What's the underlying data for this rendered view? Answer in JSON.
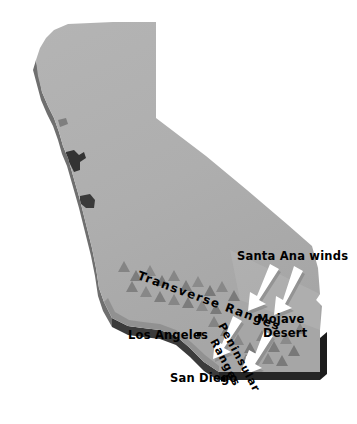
{
  "map": {
    "title": "California Santa Ana Winds",
    "region": "California",
    "colors": {
      "background": "#ffffff",
      "surface": "#adadad",
      "surface_highlight": "#b8b8b8",
      "coast_edge": "#6f6f6f",
      "base_edge": "#262626",
      "bay_notch": "#3a3a3a",
      "mountain": "#8a8a8a",
      "mountain_shadow": "#6b6b6b",
      "arrow": "#ffffff",
      "arrow_shadow": "#8f8f8f",
      "city_dot": "#000000",
      "label_text": "#000000"
    },
    "labels": {
      "santa_ana_winds": "Santa Ana winds",
      "mojave": "Mojave",
      "desert": "Desert",
      "transverse_ranges": "Transverse Ranges",
      "peninsular": "Peninsular",
      "peninsular_ranges": "Ranges",
      "los_angeles": "Los Angeles",
      "san_diego": "San Diego"
    },
    "cities": [
      {
        "name": "Los Angeles",
        "x": 199,
        "y": 334
      },
      {
        "name": "San Diego",
        "x": 223,
        "y": 379
      }
    ],
    "wind_arrows": [
      {
        "name": "santa-ana-arrow-1",
        "x1": 270,
        "y1": 266,
        "x2": 250,
        "y2": 300
      },
      {
        "name": "santa-ana-arrow-2",
        "x1": 294,
        "y1": 268,
        "x2": 276,
        "y2": 305
      },
      {
        "name": "santa-ana-arrow-3",
        "x1": 233,
        "y1": 318,
        "x2": 213,
        "y2": 348
      },
      {
        "name": "santa-ana-arrow-4",
        "x1": 264,
        "y1": 333,
        "x2": 244,
        "y2": 364
      },
      {
        "name": "santa-ana-arrow-5",
        "x1": 249,
        "y1": 352,
        "x2": 230,
        "y2": 381
      }
    ]
  }
}
